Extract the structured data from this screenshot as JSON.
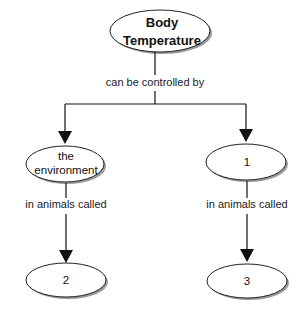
{
  "diagram": {
    "type": "concept-map",
    "nodes": {
      "root": {
        "label_line1": "Body",
        "label_line2": "Temperature"
      },
      "left": {
        "label_line1": "the",
        "label_line2": "environment"
      },
      "right": {
        "label": "1"
      },
      "bottom_left": {
        "label": "2"
      },
      "bottom_right": {
        "label": "3"
      }
    },
    "edges": {
      "root_to_children": {
        "label": "can be controlled by"
      },
      "left_to_bottom": {
        "label": "in animals called"
      },
      "right_to_bottom": {
        "label": "in animals called"
      }
    },
    "colors": {
      "stroke": "#111111",
      "shadow": "#888888",
      "fill": "#ffffff"
    }
  }
}
